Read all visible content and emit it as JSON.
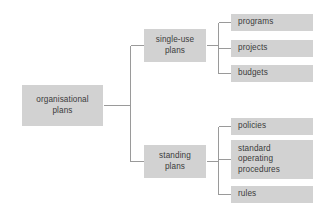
{
  "diagram": {
    "type": "hierarchy-tree",
    "orientation": "left-to-right",
    "box_fill": "#d2d2d2",
    "text_color": "#3b3b3b",
    "line_color": "#9a9a9a",
    "background": "#ffffff",
    "nodes": {
      "root": {
        "label": "organisational\nplans",
        "level": 1
      },
      "branch_single_use": {
        "label": "single-use\nplans",
        "level": 2
      },
      "branch_standing": {
        "label": "standing\nplans",
        "level": 2
      },
      "leaf_programs": {
        "label": "programs",
        "level": 3
      },
      "leaf_projects": {
        "label": "projects",
        "level": 3
      },
      "leaf_budgets": {
        "label": "budgets",
        "level": 3
      },
      "leaf_policies": {
        "label": "policies",
        "level": 3
      },
      "leaf_sop": {
        "label": "standard\noperating\nprocedures",
        "level": 3
      },
      "leaf_rules": {
        "label": "rules",
        "level": 3
      }
    },
    "edges": [
      {
        "from": "root",
        "to": "branch_single_use"
      },
      {
        "from": "root",
        "to": "branch_standing"
      },
      {
        "from": "branch_single_use",
        "to": "leaf_programs"
      },
      {
        "from": "branch_single_use",
        "to": "leaf_projects"
      },
      {
        "from": "branch_single_use",
        "to": "leaf_budgets"
      },
      {
        "from": "branch_standing",
        "to": "leaf_policies"
      },
      {
        "from": "branch_standing",
        "to": "leaf_sop"
      },
      {
        "from": "branch_standing",
        "to": "leaf_rules"
      }
    ]
  }
}
